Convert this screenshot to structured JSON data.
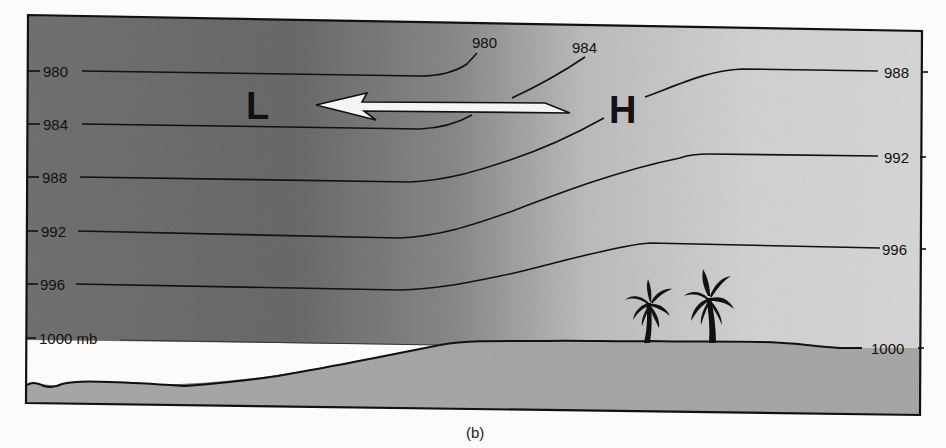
{
  "figure": {
    "caption": "(b)",
    "low_label": "L",
    "high_label": "H",
    "arrow": {
      "direction": "from H toward L",
      "meaning": "pressure gradient / wind flow"
    },
    "colors": {
      "sky_dark": "#6e6e6e",
      "sky_light": "#d6d6d6",
      "ground": "#a9a9a9",
      "lowland_gap": "#fbfbfb",
      "line": "#111111",
      "arrow_fill": "#f4f4f4"
    },
    "left_labels": [
      {
        "text": "980",
        "y": 71
      },
      {
        "text": "984",
        "y": 124
      },
      {
        "text": "988",
        "y": 177
      },
      {
        "text": "992",
        "y": 231
      },
      {
        "text": "996",
        "y": 284
      },
      {
        "text": "1000 mb",
        "y": 338
      }
    ],
    "right_labels": [
      {
        "text": "988",
        "y": 72
      },
      {
        "text": "992",
        "y": 157
      },
      {
        "text": "996",
        "y": 249
      },
      {
        "text": "1000",
        "y": 348
      }
    ],
    "top_labels": [
      {
        "text": "980"
      },
      {
        "text": "984"
      }
    ],
    "isobars_mb": [
      980,
      984,
      988,
      992,
      996,
      1000
    ],
    "scene": {
      "palm_trees": 2
    }
  }
}
